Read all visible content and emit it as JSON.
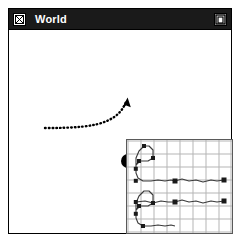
{
  "window": {
    "title": "World",
    "close_box_icon": "close-x-box-icon",
    "zoom_box_icon": "maximize-nested-square-icon",
    "titlebar_color": "#1a1a1a",
    "title_text_color": "#ffffff",
    "frame_color": "#000000",
    "canvas_color": "#ffffff"
  },
  "canvas": {
    "name": "world-canvas",
    "ink_color": "#000000",
    "trajectory": {
      "name": "dotted-trajectory-arrow",
      "style": "dotted",
      "dot_color": "#000000",
      "start": [
        36,
        98
      ],
      "end": [
        117,
        73
      ],
      "path": "M 36 98 C 64 98, 86 97, 100 90 C 110 85, 114 79, 117 73",
      "arrowhead_tip": [
        118,
        70
      ],
      "arrowhead_color": "#000000"
    },
    "agent_ball": {
      "name": "agent-ball",
      "cx": 119,
      "cy": 131,
      "r": 7,
      "color": "#000000"
    }
  },
  "inset": {
    "name": "minimap-panel",
    "border_color": "#5a5a5a",
    "grid": {
      "columns": 8,
      "rows": 7,
      "line_color": "#b5b5b5",
      "cell_width": 12.6,
      "cell_height": 12.6,
      "show_grid": true
    },
    "paths": [
      {
        "name": "upper-track",
        "stroke_color": "#3a3a3a",
        "points": "9,29 9,18 12,11 17,6 22,6 26,10 26,18 21,21 13,21 9,25 9,33 11,38 16,41 24,41 31,40 38,41 44,40 48,41",
        "nodes": [
          {
            "x": 48,
            "y": 41,
            "size": 5
          },
          {
            "x": 97,
            "y": 40,
            "size": 5
          }
        ],
        "tail": "48,41 55,39 62,41 69,40 76,42 84,40 90,41 97,40"
      },
      {
        "name": "lower-track",
        "stroke_color": "#3a3a3a",
        "points": "9,74 9,63 12,56 17,51 22,51 26,55 26,63 21,66 13,66 9,70 9,78 11,83 16,86 24,86 31,85 38,86 44,85 48,86",
        "nodes": [
          {
            "x": 48,
            "y": 62,
            "size": 5
          },
          {
            "x": 97,
            "y": 61,
            "size": 5
          }
        ],
        "tail": "9,62 18,61 26,63 34,61 41,62 48,62 55,60 62,62 69,61 76,63 84,61 90,62 97,61"
      }
    ]
  }
}
